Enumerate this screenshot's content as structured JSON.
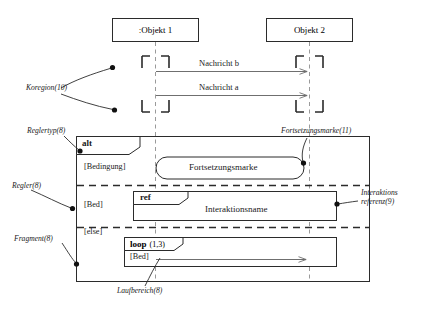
{
  "diagram": {
    "lifelines": [
      {
        "id": "obj1",
        "label": ":Objekt 1"
      },
      {
        "id": "obj2",
        "label": "Objekt 2"
      }
    ],
    "messages": [
      {
        "id": "msg-b",
        "label": "Nachricht b"
      },
      {
        "id": "msg-a",
        "label": "Nachricht a"
      }
    ],
    "combined_fragment": {
      "operator": "alt",
      "operands": [
        {
          "guard": "[Bedingung]",
          "content_label": "Fortsetzungsmarke"
        },
        {
          "guard": "[Bed]",
          "operator": "ref",
          "content_label": "Interaktionsname"
        },
        {
          "guard": "[else]",
          "operator": "loop",
          "operator_args": "(1,3)",
          "inner_guard": "[Bed]"
        }
      ]
    },
    "annotations": [
      {
        "id": "koregion",
        "text": "Koregion(10)"
      },
      {
        "id": "reglertyp",
        "text": "Reglertyp(8)"
      },
      {
        "id": "regler",
        "text": "Regler(8)"
      },
      {
        "id": "fragment",
        "text": "Fragment(8)"
      },
      {
        "id": "fortsetzungsmarke",
        "text": "Fortsetzungsmarke(11)"
      },
      {
        "id": "interaktionsreferenz",
        "text": "Interaktions referenz(9)"
      },
      {
        "id": "laufbereich",
        "text": "Laufbereich(8)"
      }
    ],
    "colors": {
      "stroke": "#2b2b2b",
      "lifeline": "#8a8a8a",
      "background": "#ffffff",
      "annotation": "#1a1a1a"
    }
  }
}
